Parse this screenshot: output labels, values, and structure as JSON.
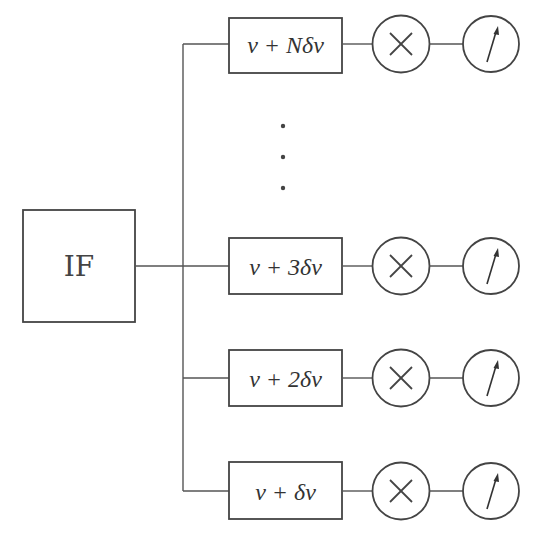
{
  "diagram": {
    "source": {
      "label": "IF",
      "box": {
        "x": 23,
        "y": 210,
        "w": 112,
        "h": 112
      },
      "output_y": 266
    },
    "bus": {
      "x": 183,
      "y_top": 44,
      "y_bottom": 491
    },
    "ellipsis": {
      "x": 283,
      "dots_y": [
        126,
        157,
        188
      ]
    },
    "channels": [
      {
        "id": "channel-n",
        "filter_label": "ν + Nδν",
        "y": 44,
        "box_top": 18,
        "box_h": 55
      },
      {
        "id": "channel-3",
        "filter_label": "ν + 3δν",
        "y": 266,
        "box_top": 238,
        "box_h": 56
      },
      {
        "id": "channel-2",
        "filter_label": "ν + 2δν",
        "y": 378,
        "box_top": 350,
        "box_h": 56
      },
      {
        "id": "channel-1",
        "filter_label": "ν + δν",
        "y": 491,
        "box_top": 462,
        "box_h": 57
      }
    ],
    "filter_box": {
      "x": 229,
      "w": 113
    },
    "mixer": {
      "cx": 401,
      "r": 28.5,
      "symbol": "multiply-icon"
    },
    "meter": {
      "cx": 491,
      "r": 28,
      "symbol": "meter-needle-icon"
    },
    "colors": {
      "line": "#555555",
      "stroke": "#444444",
      "text": "#333333",
      "background": "#ffffff"
    }
  }
}
